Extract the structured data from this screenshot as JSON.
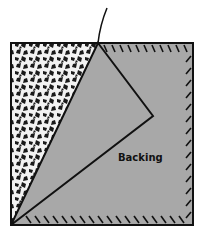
{
  "diagram": {
    "type": "peel-off backing illustration",
    "labels": {
      "backing": "Backing"
    },
    "colors": {
      "backing_fill": "#a8a8a8",
      "outline": "#111111",
      "texture_dark": "#1a1a1a",
      "texture_light": "#f2f2f2"
    },
    "regions": [
      {
        "name": "textured-adhesive-surface",
        "position": "left"
      },
      {
        "name": "backing-sheet",
        "position": "right"
      },
      {
        "name": "peeled-corner-flap",
        "position": "center"
      }
    ]
  }
}
